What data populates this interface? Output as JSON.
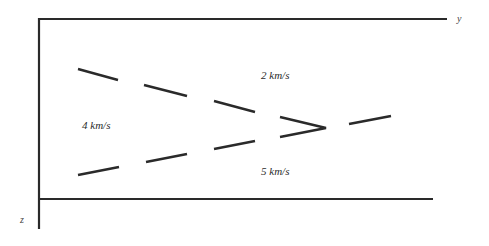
{
  "axes": {
    "horizontal_label": "y",
    "vertical_label": "z"
  },
  "layers": [
    {
      "name": "upper-layer",
      "velocity_label": "2 km/s"
    },
    {
      "name": "wedge-layer",
      "velocity_label": "4 km/s"
    },
    {
      "name": "lower-layer",
      "velocity_label": "5 km/s"
    }
  ],
  "interfaces": {
    "upper_dashed": "dashed line dipping down to the right",
    "lower_dashed": "dashed line rising to the right",
    "pinch_out": "wedge pinch-out marked by '>' shape",
    "continuation": "single dashed segment rising to the right beyond pinch-out"
  },
  "colors": {
    "stroke": "#2a2a2a",
    "background": "#ffffff"
  }
}
